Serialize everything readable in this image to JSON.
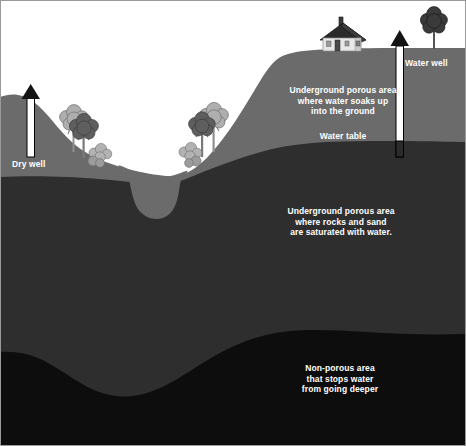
{
  "diagram": {
    "labels": {
      "unsaturated_zone": "Underground porous area\nwhere water soaks up\ninto the ground",
      "water_table": "Water table",
      "saturated_zone": "Underground porous area\nwhere rocks and sand\nare saturated with water.",
      "non_porous_zone": "Non-porous area\nthat stops water\nfrom going deeper",
      "dry_well": "Dry well",
      "water_well": "Water well"
    },
    "colors": {
      "sky": "#ffffff",
      "unsaturated": "#6b6b6b",
      "saturated": "#2e2e2e",
      "non_porous": "#0d0d0d",
      "well_shaft": "#ffffff",
      "well_outline": "#000000",
      "label_text": "#ffffff",
      "tree_light": "#a8a8a8",
      "tree_dark": "#5e5e5e",
      "tree_top": "#3a3a3a",
      "house_wall": "#e8e8e8",
      "house_roof": "#2b2b2b",
      "border": "#9a9a9a"
    },
    "elements": {
      "house": "house-icon",
      "tree_left_light": "tree-icon",
      "tree_left_dark": "tree-icon",
      "bush_left": "bush-icon",
      "tree_mid_light": "tree-icon",
      "tree_mid_dark": "tree-icon",
      "bush_mid": "bush-icon",
      "tree_right": "tree-icon",
      "dry_well_arrow": "up-arrow-icon",
      "water_well_arrow": "up-arrow-icon"
    }
  }
}
